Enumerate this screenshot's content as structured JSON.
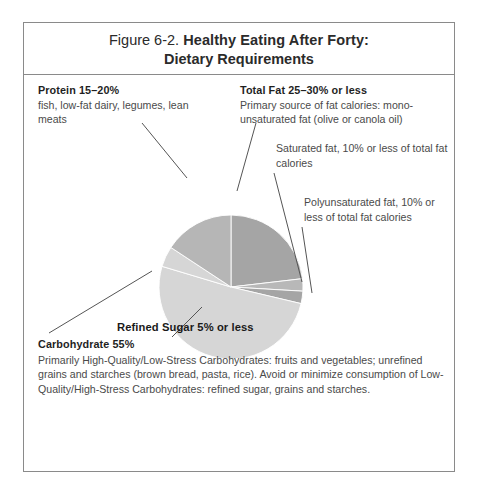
{
  "figure": {
    "number_label": "Figure 6-2.",
    "title_line_1": "Healthy Eating After Forty:",
    "title_line_2": "Dietary Requirements"
  },
  "annotations": {
    "protein": {
      "heading": "Protein 15–20%",
      "body": "fish, low-fat dairy, legumes, lean meats"
    },
    "total_fat": {
      "heading": "Total Fat 25–30% or less",
      "body": "Primary source of fat calories: mono-unsaturated fat (olive or canola oil)"
    },
    "saturated_fat": {
      "body": "Saturated fat, 10% or less of total fat calories"
    },
    "polyunsaturated_fat": {
      "body": "Polyunsaturated fat, 10% or less of total fat calories"
    },
    "refined_sugar": {
      "label": "Refined Sugar 5% or less"
    },
    "carbohydrate": {
      "heading": "Carbohydrate 55%",
      "body": "Primarily High-Quality/Low-Stress Carbohydrates: fruits and vegetables; unrefined grains and starches (brown bread, pasta, rice). Avoid or minimize consumption of Low-Quality/High-Stress Carbohydrates: refined sugar, grains and starches."
    }
  },
  "chart_data": {
    "type": "pie",
    "title": "Healthy Eating After Forty: Dietary Requirements",
    "legend": "none",
    "center": [
      207,
      212
    ],
    "radius": 72,
    "start_angle_deg": 0,
    "direction": "clockwise",
    "categories": [
      "Total Fat 25–30% or less",
      "Saturated fat, 10% or less of total fat calories",
      "Polyunsaturated fat, 10% or less of total fat calories",
      "Carbohydrate 55%",
      "Refined Sugar 5% or less",
      "Protein 15–20%"
    ],
    "values": [
      25,
      3,
      3,
      55,
      5,
      17
    ],
    "units": "percent of daily calories",
    "colors": [
      "#a5a5a5",
      "#b8b8b8",
      "#a5a5a5",
      "#d6d6d6",
      "#d6d6d6",
      "#b6b6b6"
    ],
    "slices": [
      {
        "label": "Total Fat 25–30% or less",
        "value": 25,
        "color": "#a5a5a5"
      },
      {
        "label": "Saturated fat, 10% or less of total fat calories",
        "value": 3,
        "color": "#b8b8b8"
      },
      {
        "label": "Polyunsaturated fat, 10% or less of total fat calories",
        "value": 3,
        "color": "#a5a5a5"
      },
      {
        "label": "Carbohydrate 55%",
        "value": 55,
        "color": "#d6d6d6"
      },
      {
        "label": "Refined Sugar 5% or less",
        "value": 5,
        "color": "#d6d6d6"
      },
      {
        "label": "Protein 15–20%",
        "value": 17,
        "color": "#b6b6b6"
      }
    ]
  },
  "colors": {
    "frame_border": "#8a8a8a",
    "text": "#4a4a4a",
    "heading_text": "#1f1f1f",
    "leader_line": "#555555",
    "pie_dark": "#a5a5a5",
    "pie_medium": "#b6b6b6",
    "pie_light": "#d6d6d6",
    "background": "#ffffff"
  }
}
